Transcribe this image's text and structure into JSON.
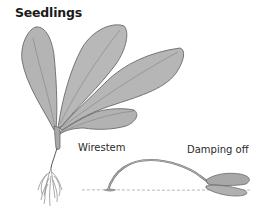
{
  "figure": {
    "title": "Seedlings",
    "labels": {
      "wirestem": "Wirestem",
      "damping_off": "Damping off"
    },
    "colors": {
      "leaf_fill": "#b4b4b4",
      "leaf_stroke": "#6a6a6a",
      "vein": "#8a8a8a",
      "text": "#2a2a2a",
      "background": "#ffffff"
    }
  }
}
